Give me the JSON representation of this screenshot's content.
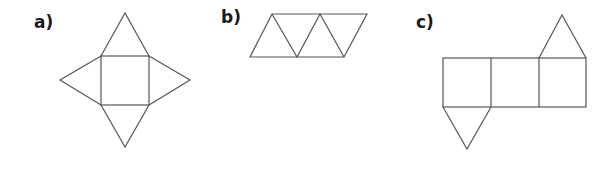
{
  "labels": {
    "a": "a)",
    "b": "b)",
    "c": "c)"
  },
  "figures": [
    {
      "id": "a",
      "description": "Net of square pyramid: square with four triangles"
    },
    {
      "id": "b",
      "description": "Net of tetrahedron: four triangles in a strip"
    },
    {
      "id": "c",
      "description": "Net of triangular prism: three squares with two triangles"
    }
  ],
  "colors": {
    "stroke": "#555555",
    "label": "#1a1a1a"
  }
}
